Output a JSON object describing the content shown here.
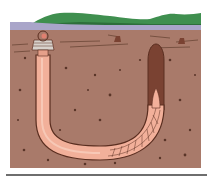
{
  "figure": {
    "colors": {
      "sky": "#ffffff",
      "hills": "#3f8f4f",
      "hills_dark": "#2d6e3b",
      "water": "#a9a5c9",
      "sand": "#a97a6a",
      "sand_line": "#6b4636",
      "speck": "#5a3528",
      "burrow_outline": "#5a2e20",
      "worm": "#f2b09a",
      "worm_light": "#f7c8b6",
      "shaft": "#7a4232",
      "divider": "#6e6e6e"
    }
  }
}
